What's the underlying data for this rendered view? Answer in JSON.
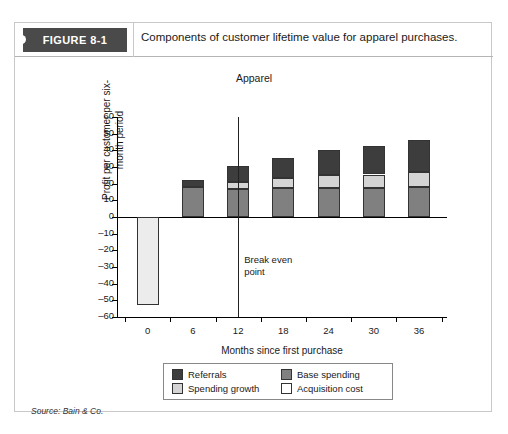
{
  "figure": {
    "tag": "FIGURE 8-1",
    "caption": "Components of customer lifetime value for apparel purchases.",
    "source": "Source: Bain & Co."
  },
  "chart_data": {
    "type": "bar",
    "stacked": true,
    "title": "Apparel",
    "xlabel": "Months since first purchase",
    "ylabel": "Profit per customer per six-month period",
    "categories": [
      "0",
      "6",
      "12",
      "18",
      "24",
      "30",
      "36"
    ],
    "ylim": [
      -60,
      60
    ],
    "yticks": [
      "60",
      "50",
      "40",
      "30",
      "20",
      "10",
      "0",
      "–10",
      "–20",
      "–30",
      "–40",
      "–50",
      "–60"
    ],
    "grid": false,
    "legend_position": "bottom",
    "series": [
      {
        "name": "Base spending",
        "color": "#808080",
        "values": [
          0,
          18,
          17,
          17.5,
          17.5,
          17.5,
          18
        ]
      },
      {
        "name": "Spending growth",
        "color": "#d4d4d4",
        "values": [
          0,
          0,
          4,
          6,
          8,
          8,
          9
        ]
      },
      {
        "name": "Referrals",
        "color": "#3d3d3d",
        "values": [
          0,
          4,
          9.5,
          12,
          15,
          17,
          19
        ]
      },
      {
        "name": "Acquisition cost",
        "color": "#ececec",
        "values": [
          -53,
          0,
          0,
          0,
          0,
          0,
          0
        ]
      }
    ],
    "totals": [
      -53,
      22,
      30.5,
      35.5,
      40.5,
      42.5,
      46
    ],
    "annotations": [
      {
        "name": "break-even",
        "text_line1": "Break even",
        "text_line2": "point",
        "x_value": 12
      }
    ]
  },
  "legend": {
    "items": [
      {
        "label": "Referrals",
        "color": "#3d3d3d"
      },
      {
        "label": "Base spending",
        "color": "#808080"
      },
      {
        "label": "Spending growth",
        "color": "#d4d4d4"
      },
      {
        "label": "Acquisition cost",
        "color": "#ffffff"
      }
    ]
  }
}
